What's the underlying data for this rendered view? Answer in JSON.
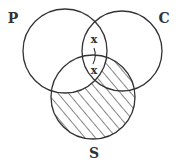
{
  "diagram": {
    "type": "venn",
    "sets": [
      {
        "id": "P",
        "label": "P",
        "cx": 65,
        "cy": 51,
        "r": 42,
        "label_x": 13,
        "label_y": 23
      },
      {
        "id": "C",
        "label": "C",
        "cx": 122,
        "cy": 51,
        "r": 40,
        "label_x": 164,
        "label_y": 23
      },
      {
        "id": "S",
        "label": "S",
        "cx": 93,
        "cy": 97,
        "r": 42,
        "label_x": 94,
        "label_y": 158
      }
    ],
    "marks": [
      {
        "label": "x",
        "region": "P∩C (outside S)",
        "x": 94,
        "y": 43
      },
      {
        "label": "x",
        "region": "P∩C∩S",
        "x": 94,
        "y": 73
      }
    ],
    "connector": {
      "description": "curved line linking the two x marks across the S boundary"
    },
    "shading": {
      "region": "S minus P",
      "pattern": "diagonal hatching",
      "spacing": 8
    },
    "colors": {
      "stroke": "#333333",
      "background": "#ffffff"
    }
  }
}
